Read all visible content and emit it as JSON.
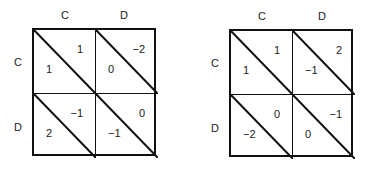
{
  "matrices": [
    {
      "col_labels": [
        "C",
        "D"
      ],
      "row_labels": [
        "C",
        "D"
      ],
      "cells": [
        [
          {
            "upper": "1",
            "lower": "1"
          },
          {
            "upper": "−2",
            "lower": "0"
          }
        ],
        [
          {
            "upper": "−1",
            "lower": "2"
          },
          {
            "upper": "0",
            "lower": "−1"
          }
        ]
      ]
    },
    {
      "col_labels": [
        "C",
        "D"
      ],
      "row_labels": [
        "C",
        "D"
      ],
      "cells": [
        [
          {
            "upper": "1",
            "lower": "1"
          },
          {
            "upper": "2",
            "lower": "−1"
          }
        ],
        [
          {
            "upper": "0",
            "lower": "−2"
          },
          {
            "upper": "−1",
            "lower": "0"
          }
        ]
      ]
    }
  ]
}
